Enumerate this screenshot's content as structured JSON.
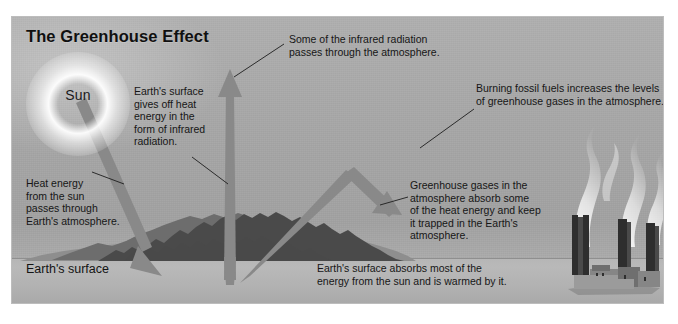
{
  "figure": {
    "title": "The Greenhouse Effect",
    "sun_label": "Sun",
    "surface_label": "Earth's surface"
  },
  "annotations": {
    "infrared_escapes": "Some of the infrared radiation\npasses through the atmosphere.",
    "fossil_fuels": "Burning fossil fuels increases the levels\nof greenhouse gases in the atmosphere.",
    "surface_gives_off": "Earth's surface\ngives off heat\nenergy in the\nform of infrared\nradiation.",
    "heat_from_sun": "Heat energy\nfrom the sun\npasses through\nEarth's atmosphere.",
    "greenhouse_gases": "Greenhouse gases in the\natmosphere absorb some\nof the heat energy and keep\nit trapped in the Earth's\natmosphere.",
    "surface_absorbs": "Earth's surface absorbs most of the\nenergy from the sun and is warmed by it."
  },
  "icons": {
    "sun": "sun-icon",
    "factory": "factory-icon",
    "smoke": "smoke-plume-icon",
    "mountains": "mountain-range-icon",
    "arrow_incoming": "incoming-solar-arrow-icon",
    "arrow_outgoing": "outgoing-infrared-arrow-icon",
    "arrow_reflected": "reflected-heat-arrow-icon"
  },
  "colors": {
    "sky": "#a6a6a6",
    "ground": "#b6b6b6",
    "arrow": "#898989",
    "text": "#161616",
    "mountain_dark": "#4a4a4a",
    "stack": "#2e2e2e",
    "page_background": "#ffffff"
  }
}
